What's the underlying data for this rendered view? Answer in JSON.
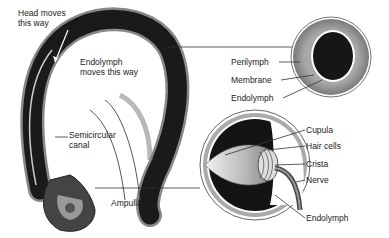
{
  "diagram": {
    "labels": {
      "head_moves": [
        "Head moves",
        "this way"
      ],
      "endolymph_moves": [
        "Endolymph",
        "moves this way"
      ],
      "semicircular_canal": [
        "Semicircular",
        "canal"
      ],
      "ampulla": "Ampulla",
      "perilymph": "Perilymph",
      "membrane": "Membrane",
      "endolymph_top": "Endolymph",
      "cupula": "Cupula",
      "hair_cells": "Hair cells",
      "crista": "Crista",
      "nerve": "Nerve",
      "endolymph_bottom": "Endolymph"
    },
    "colors": {
      "canal_dark": "#1a1a1a",
      "canal_edge": "#8a8a8a",
      "perilymph": "#9a9a9a",
      "endolymph": "#151515",
      "cupula": "#d0d0d0"
    }
  }
}
